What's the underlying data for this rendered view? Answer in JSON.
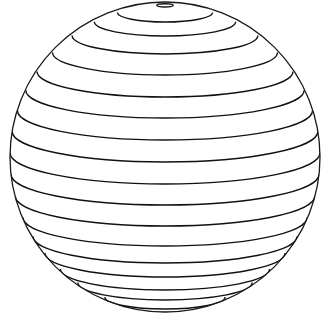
{
  "figure": {
    "canvas": {
      "width": 330,
      "height": 315,
      "background": "#ffffff"
    },
    "sphere": {
      "cx": 165,
      "cy": 157,
      "r": 155,
      "stroke": "#1a1a1a",
      "stroke_width": 1.3
    },
    "tilt_sin": 0.2,
    "latitude_line_color": "#111111",
    "latitude_line_width": 1.4,
    "latitude_center_crossings_y": [
      7,
      22,
      36,
      54,
      75,
      97,
      118,
      140,
      162,
      184,
      205,
      226,
      246,
      263,
      277,
      290,
      300,
      309
    ]
  }
}
